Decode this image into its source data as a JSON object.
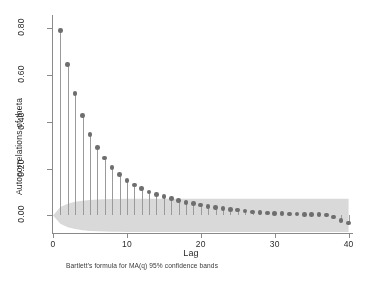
{
  "chart_data": {
    "type": "bar",
    "title": "",
    "xlabel": "Lag",
    "ylabel": "Autocorrelations of theta",
    "caption": "Bartlett's formula for MA(q) 95% confidence bands",
    "xlim": [
      0,
      40.6
    ],
    "ylim": [
      -0.075,
      0.855
    ],
    "grid": false,
    "legend": null,
    "x_ticks": [
      0,
      10,
      20,
      30,
      40
    ],
    "x_tick_labels": [
      "0",
      "10",
      "20",
      "30",
      "40"
    ],
    "y_ticks": [
      0.0,
      0.2,
      0.4,
      0.6,
      0.8
    ],
    "y_tick_labels": [
      "0.00",
      "0.20",
      "0.40",
      "0.60",
      "0.80"
    ],
    "marker_color": "#6e6e6e",
    "stem_color": "#9a9a9a",
    "band_color": "#d9d9d9",
    "x": [
      1,
      2,
      3,
      4,
      5,
      6,
      7,
      8,
      9,
      10,
      11,
      12,
      13,
      14,
      15,
      16,
      17,
      18,
      19,
      20,
      21,
      22,
      23,
      24,
      25,
      26,
      27,
      28,
      29,
      30,
      31,
      32,
      33,
      34,
      35,
      36,
      37,
      38,
      39,
      40
    ],
    "values": [
      0.79,
      0.645,
      0.52,
      0.425,
      0.345,
      0.29,
      0.245,
      0.205,
      0.175,
      0.15,
      0.13,
      0.115,
      0.1,
      0.09,
      0.08,
      0.072,
      0.064,
      0.056,
      0.05,
      0.044,
      0.038,
      0.034,
      0.03,
      0.026,
      0.023,
      0.019,
      0.015,
      0.012,
      0.01,
      0.008,
      0.007,
      0.006,
      0.006,
      0.005,
      0.005,
      0.004,
      0.002,
      -0.006,
      -0.022,
      -0.032
    ],
    "confidence_band": {
      "label": "Bartlett 95% confidence bands",
      "upper": [
        0.036,
        0.05,
        0.058,
        0.063,
        0.066,
        0.068,
        0.069,
        0.07,
        0.07,
        0.071,
        0.071,
        0.071,
        0.071,
        0.071,
        0.071,
        0.071,
        0.071,
        0.071,
        0.071,
        0.071,
        0.071,
        0.071,
        0.071,
        0.071,
        0.071,
        0.071,
        0.071,
        0.071,
        0.071,
        0.071,
        0.071,
        0.071,
        0.071,
        0.071,
        0.071,
        0.071,
        0.071,
        0.071,
        0.071,
        0.071
      ],
      "lower": [
        -0.036,
        -0.05,
        -0.058,
        -0.063,
        -0.066,
        -0.068,
        -0.069,
        -0.07,
        -0.07,
        -0.071,
        -0.071,
        -0.071,
        -0.071,
        -0.071,
        -0.071,
        -0.071,
        -0.071,
        -0.071,
        -0.071,
        -0.071,
        -0.071,
        -0.071,
        -0.071,
        -0.071,
        -0.071,
        -0.071,
        -0.071,
        -0.071,
        -0.071,
        -0.071,
        -0.071,
        -0.071,
        -0.071,
        -0.071,
        -0.071,
        -0.071,
        -0.071,
        -0.071,
        -0.071,
        -0.071
      ]
    }
  }
}
